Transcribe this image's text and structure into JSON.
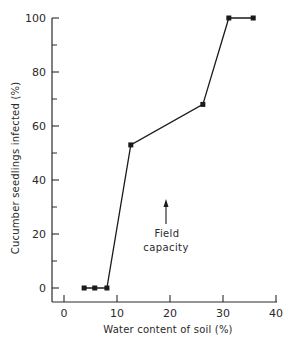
{
  "chart_data": {
    "type": "line",
    "title": "",
    "xlabel": "Water content of soil (%)",
    "ylabel": "Cucumber seedlings infected (%)",
    "xlim": [
      -2,
      40
    ],
    "ylim": [
      -5,
      100
    ],
    "xticks": [
      0,
      10,
      20,
      30,
      40
    ],
    "yticks": [
      0,
      20,
      40,
      60,
      80,
      100
    ],
    "yminor_ticks": [
      10,
      30,
      50,
      70,
      90
    ],
    "grid": false,
    "legend": null,
    "series": [
      {
        "name": "Infection",
        "x": [
          3.8,
          5.8,
          8.1,
          12.6,
          26.2,
          31.1,
          35.7
        ],
        "y": [
          0,
          0,
          0,
          53,
          68,
          100,
          100
        ],
        "marker": "square",
        "color": "#1a1a1a"
      }
    ],
    "annotations": [
      {
        "text_lines": [
          "Field",
          "capacity"
        ],
        "x": 19,
        "arrow_from_y": 23,
        "arrow_to_y": 32,
        "label_y": 20
      }
    ]
  },
  "labels": {
    "xlabel": "Water content of soil (%)",
    "ylabel": "Cucumber seedlings infected (%)",
    "annotation_line1": "Field",
    "annotation_line2": "capacity",
    "xtick_0": "0",
    "xtick_1": "10",
    "xtick_2": "20",
    "xtick_3": "30",
    "xtick_4": "40",
    "ytick_0": "0",
    "ytick_1": "20",
    "ytick_2": "40",
    "ytick_3": "60",
    "ytick_4": "80",
    "ytick_5": "100"
  }
}
